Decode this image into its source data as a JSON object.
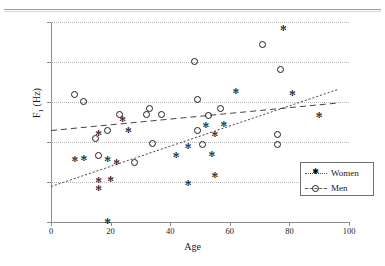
{
  "chart_data": {
    "type": "scatter",
    "title": "",
    "xlabel": "Age",
    "ylabel": "F1 (Hz)",
    "xlim": [
      0,
      100
    ],
    "ylim": [
      1500,
      2250
    ],
    "xticks": [
      0,
      20,
      40,
      60,
      80,
      100
    ],
    "yticks": [
      1500,
      1650,
      1800,
      1950,
      2100,
      2250
    ],
    "grid": "horizontal-dotted",
    "legend_position": "bottom-right",
    "series": [
      {
        "name": "Women",
        "marker": "asterisk",
        "line_style": "dotted",
        "points": [
          {
            "x": 8,
            "y": 1733
          },
          {
            "x": 11,
            "y": 1740
          },
          {
            "x": 16,
            "y": 1831
          },
          {
            "x": 16,
            "y": 1656
          },
          {
            "x": 16,
            "y": 1627
          },
          {
            "x": 19,
            "y": 1503
          },
          {
            "x": 19,
            "y": 1736
          },
          {
            "x": 20,
            "y": 1660
          },
          {
            "x": 22,
            "y": 1722
          },
          {
            "x": 24,
            "y": 1886
          },
          {
            "x": 26,
            "y": 1843
          },
          {
            "x": 42,
            "y": 1748
          },
          {
            "x": 46,
            "y": 1646
          },
          {
            "x": 46,
            "y": 1782
          },
          {
            "x": 52,
            "y": 1861
          },
          {
            "x": 54,
            "y": 1754
          },
          {
            "x": 55,
            "y": 1675
          },
          {
            "x": 55,
            "y": 1830
          },
          {
            "x": 58,
            "y": 1864
          },
          {
            "x": 62,
            "y": 1988
          },
          {
            "x": 78,
            "y": 2226
          },
          {
            "x": 81,
            "y": 1982
          },
          {
            "x": 90,
            "y": 1901
          }
        ],
        "trend_line": {
          "x0": 0,
          "y0": 1633,
          "x1": 96,
          "y1": 1996
        }
      },
      {
        "name": "Men",
        "marker": "circle",
        "line_style": "dashed",
        "points": [
          {
            "x": 8,
            "y": 1977
          },
          {
            "x": 11,
            "y": 1951
          },
          {
            "x": 15,
            "y": 1813
          },
          {
            "x": 16,
            "y": 1748
          },
          {
            "x": 19,
            "y": 1842
          },
          {
            "x": 23,
            "y": 1902
          },
          {
            "x": 28,
            "y": 1722
          },
          {
            "x": 32,
            "y": 1904
          },
          {
            "x": 33,
            "y": 1925
          },
          {
            "x": 34,
            "y": 1795
          },
          {
            "x": 37,
            "y": 1902
          },
          {
            "x": 48,
            "y": 2103
          },
          {
            "x": 49,
            "y": 1843
          },
          {
            "x": 49,
            "y": 1958
          },
          {
            "x": 51,
            "y": 1791
          },
          {
            "x": 53,
            "y": 1898
          },
          {
            "x": 57,
            "y": 1926
          },
          {
            "x": 71,
            "y": 2166
          },
          {
            "x": 76,
            "y": 1828
          },
          {
            "x": 76,
            "y": 1791
          },
          {
            "x": 77,
            "y": 2071
          }
        ],
        "trend_line": {
          "x0": 0,
          "y0": 1843,
          "x1": 97,
          "y1": 1947
        }
      }
    ]
  },
  "legend": {
    "items": [
      {
        "label": "Women"
      },
      {
        "label": "Men"
      }
    ]
  },
  "colors": {
    "axis": "#8d8d8d",
    "grid": "#b9b9b9",
    "marker": "#1c1c1c",
    "legend_border": "#6e6e6e",
    "background": "#ffffff"
  }
}
